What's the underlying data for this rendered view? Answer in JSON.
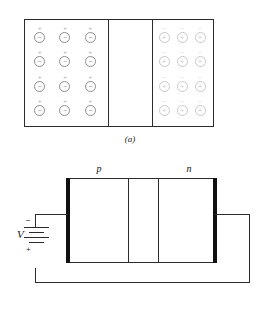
{
  "figure": {
    "colors": {
      "line": "#2b2b2b",
      "electrode": "#111111",
      "acceptor_ion": "#8e8e8e",
      "donor_ion": "#c9c9c9",
      "background": "#ffffff"
    }
  },
  "panel_a": {
    "caption": "(a)",
    "p_region": {
      "name": "p-type region",
      "rows": 4,
      "cols": 3,
      "ion_symbol": "−",
      "free_carrier_symbol": "+",
      "cells": [
        {
          "ion": "−",
          "carrier": "+"
        },
        {
          "ion": "−",
          "carrier": "+"
        },
        {
          "ion": "−",
          "carrier": "+"
        },
        {
          "ion": "−",
          "carrier": "+"
        },
        {
          "ion": "−",
          "carrier": "+"
        },
        {
          "ion": "−",
          "carrier": "+"
        },
        {
          "ion": "−",
          "carrier": "+"
        },
        {
          "ion": "−",
          "carrier": "+"
        },
        {
          "ion": "−",
          "carrier": "+"
        },
        {
          "ion": "−",
          "carrier": "+"
        },
        {
          "ion": "−",
          "carrier": "+"
        },
        {
          "ion": "−",
          "carrier": "+"
        }
      ]
    },
    "depletion_region": {
      "name": "depletion region",
      "label": ""
    },
    "n_region": {
      "name": "n-type region",
      "rows": 4,
      "cols": 3,
      "ion_symbol": "+",
      "free_carrier_symbol": "−",
      "cells": [
        {
          "ion": "+",
          "carrier": "−"
        },
        {
          "ion": "+",
          "carrier": "−"
        },
        {
          "ion": "+",
          "carrier": "−"
        },
        {
          "ion": "+",
          "carrier": "−"
        },
        {
          "ion": "+",
          "carrier": "−"
        },
        {
          "ion": "+",
          "carrier": "−"
        },
        {
          "ion": "+",
          "carrier": "−"
        },
        {
          "ion": "+",
          "carrier": "−"
        },
        {
          "ion": "+",
          "carrier": "−"
        },
        {
          "ion": "+",
          "carrier": "−"
        },
        {
          "ion": "+",
          "carrier": "−"
        },
        {
          "ion": "+",
          "carrier": "−"
        }
      ]
    }
  },
  "panel_b": {
    "caption": "(b)",
    "labels": {
      "p": "p",
      "n": "n"
    },
    "battery": {
      "label": "V",
      "terminal_top": "−",
      "terminal_bottom": "+",
      "plates": 4
    }
  }
}
